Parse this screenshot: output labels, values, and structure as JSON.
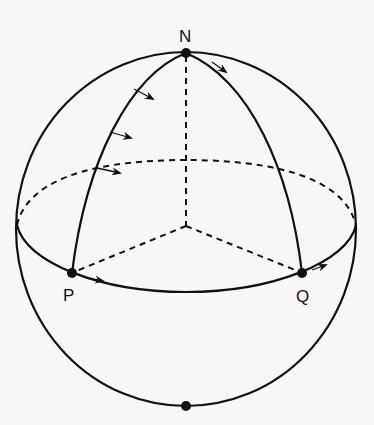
{
  "diagram": {
    "labels": {
      "north_pole": "N",
      "point_p": "P",
      "point_q": "Q"
    },
    "points": [
      {
        "id": "N",
        "x": 186,
        "y": 53
      },
      {
        "id": "P",
        "x": 72,
        "y": 273
      },
      {
        "id": "Q",
        "x": 302,
        "y": 273
      },
      {
        "id": "south",
        "x": 186,
        "y": 406
      }
    ],
    "colors": {
      "stroke": "#111111",
      "background": "#f7f7f5"
    }
  }
}
